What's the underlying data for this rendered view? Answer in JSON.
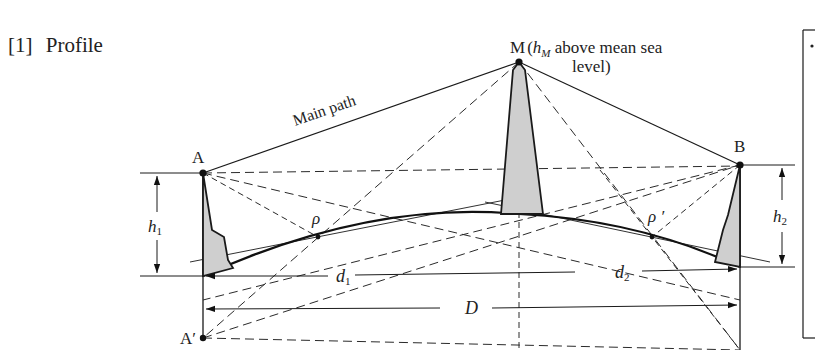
{
  "section": {
    "number": "[1]",
    "title": "Profile"
  },
  "points": {
    "A": "A",
    "A_prime": "A′",
    "B": "B",
    "M": "M"
  },
  "labels": {
    "m_annotation_prefix": "(",
    "m_annotation_var": "h",
    "m_annotation_sub": "M",
    "m_annotation_line1_rest": " above mean sea",
    "m_annotation_line2": "level)",
    "main_path": "Main path",
    "rho": "ρ",
    "rho_prime": "ρ ′",
    "h1_var": "h",
    "h1_sub": "1",
    "h2_var": "h",
    "h2_sub": "2",
    "d1_var": "d",
    "d1_sub": "1",
    "d2_var": "d",
    "d2_sub": "2",
    "D": "D"
  },
  "colors": {
    "line": "#1a1a1a",
    "terrain_fill": "#cfcfcf",
    "background": "#ffffff"
  }
}
